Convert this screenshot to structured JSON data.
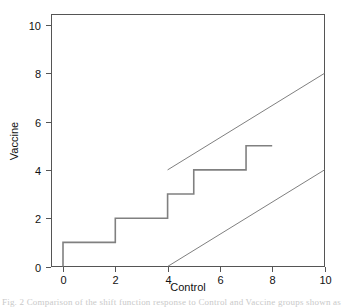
{
  "chart_data": {
    "type": "line",
    "title": "",
    "xlabel": "Control",
    "ylabel": "Vaccine",
    "xlim": [
      0,
      10.5
    ],
    "ylim": [
      0,
      10.5
    ],
    "xticks": [
      0,
      2,
      4,
      6,
      8,
      10
    ],
    "yticks": [
      0,
      2,
      4,
      6,
      8,
      10
    ],
    "xtick_labels": [
      "0",
      "2",
      "4",
      "6",
      "8",
      "10"
    ],
    "ytick_labels": [
      "0",
      "2",
      "4",
      "6",
      "8",
      "10"
    ],
    "grid": false,
    "legend": "none",
    "box": true,
    "series": [
      {
        "name": "step-function",
        "style": "step",
        "color": "#808080",
        "width": 1.6,
        "points": [
          [
            0,
            0
          ],
          [
            0,
            1
          ],
          [
            2,
            1
          ],
          [
            2,
            2
          ],
          [
            4,
            2
          ],
          [
            4,
            3
          ],
          [
            5,
            3
          ],
          [
            5,
            4
          ],
          [
            7,
            4
          ],
          [
            7,
            5
          ],
          [
            8,
            5
          ]
        ]
      },
      {
        "name": "upper-reference-line",
        "style": "line",
        "color": "#707070",
        "width": 0.9,
        "points": [
          [
            4,
            4
          ],
          [
            10,
            8
          ]
        ]
      },
      {
        "name": "lower-reference-line",
        "style": "line",
        "color": "#707070",
        "width": 0.9,
        "points": [
          [
            4,
            0
          ],
          [
            10,
            4
          ]
        ]
      }
    ]
  },
  "axes": {
    "x_title": "Control",
    "y_title": "Vaccine",
    "x_labels": [
      "0",
      "2",
      "4",
      "6",
      "8",
      "10"
    ],
    "y_labels": [
      "0",
      "2",
      "4",
      "6",
      "8",
      "10"
    ]
  },
  "caption": {
    "cut_text": "Fig. 2  Comparison of the shift function response to Control and Vaccine groups shown as a step"
  },
  "colors": {
    "background": "#ffffff",
    "axis": "#555555",
    "step_line": "#808080",
    "reference_line": "#707070",
    "text": "#111111"
  }
}
